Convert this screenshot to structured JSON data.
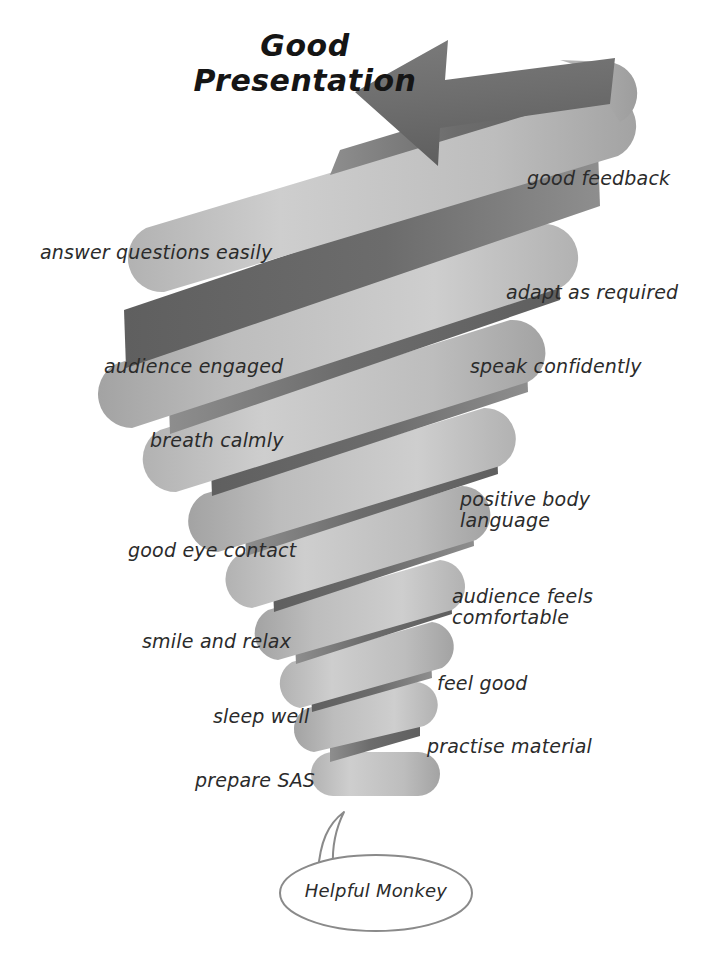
{
  "diagram": {
    "title": "Good\nPresentation",
    "title_color": "#151515",
    "background_color": "#ffffff",
    "arrow": {
      "name": "upward-left-arrow",
      "direction": "left",
      "color": "#6f6f6f"
    },
    "spiral": {
      "shape": "coiled-ribbon-spiral",
      "front_color_light": "#c3c3c3",
      "front_color_mid": "#a9a9a9",
      "back_color_dark": "#6f6f6f",
      "turns": 8,
      "direction": "bottom-to-top"
    },
    "speech_bubble": {
      "text": "Helpful Monkey",
      "outline_color": "#8a8a8a",
      "fill_color": "#ffffff"
    },
    "steps": [
      {
        "label": "good feedback",
        "side": "right",
        "x": 527,
        "y": 168,
        "size": 19
      },
      {
        "label": "answer questions easily",
        "side": "left",
        "x": 40,
        "y": 242,
        "size": 19
      },
      {
        "label": "adapt as required",
        "side": "right",
        "x": 506,
        "y": 282,
        "size": 19
      },
      {
        "label": "audience engaged",
        "side": "left",
        "x": 104,
        "y": 356,
        "size": 19
      },
      {
        "label": "speak confidently",
        "side": "right",
        "x": 470,
        "y": 356,
        "size": 19
      },
      {
        "label": "breath calmly",
        "side": "left",
        "x": 150,
        "y": 430,
        "size": 19
      },
      {
        "label": "positive body\nlanguage",
        "side": "right",
        "x": 460,
        "y": 489,
        "size": 19
      },
      {
        "label": "good eye contact",
        "side": "left",
        "x": 128,
        "y": 540,
        "size": 19
      },
      {
        "label": "audience feels\ncomfortable",
        "side": "right",
        "x": 452,
        "y": 586,
        "size": 19
      },
      {
        "label": "smile and relax",
        "side": "left",
        "x": 142,
        "y": 631,
        "size": 19
      },
      {
        "label": "feel good",
        "side": "right",
        "x": 437,
        "y": 673,
        "size": 19
      },
      {
        "label": "sleep well",
        "side": "left",
        "x": 213,
        "y": 706,
        "size": 19
      },
      {
        "label": "practise material",
        "side": "right",
        "x": 427,
        "y": 736,
        "size": 19
      },
      {
        "label": "prepare SAS",
        "side": "left",
        "x": 195,
        "y": 770,
        "size": 19
      }
    ]
  }
}
